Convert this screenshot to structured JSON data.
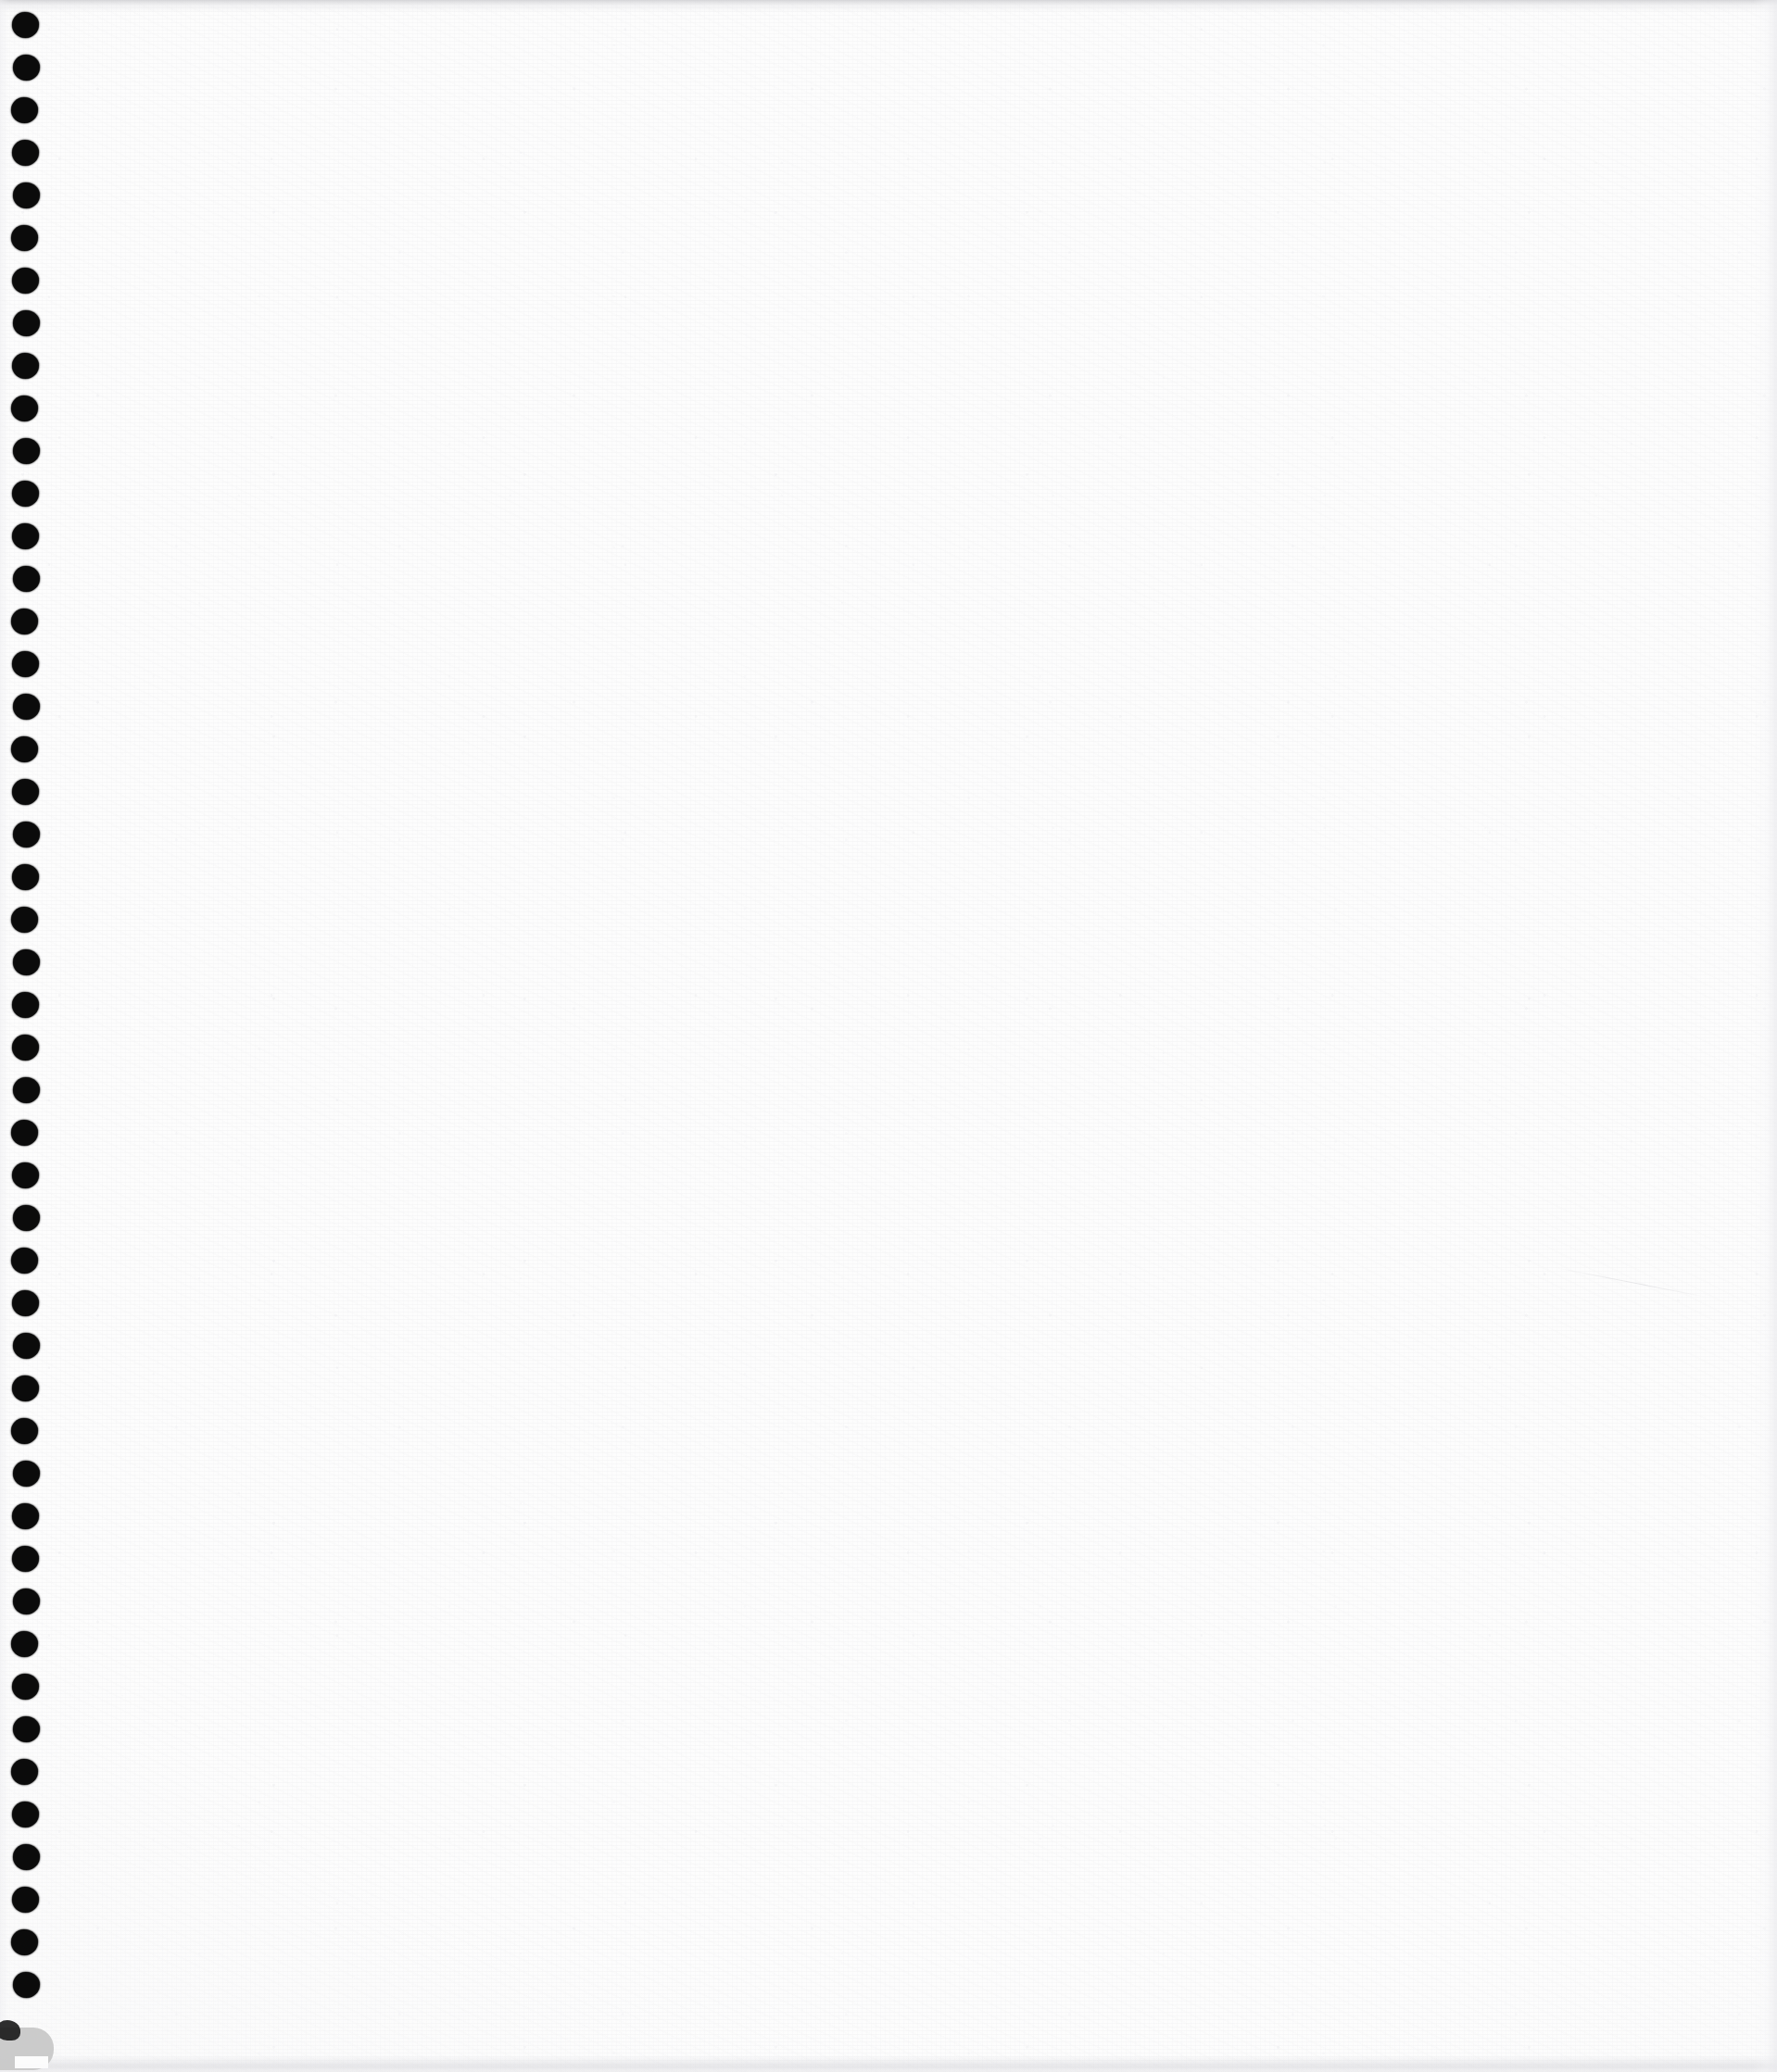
{
  "document": {
    "kind": "scanned-page",
    "media": "spiral-bound notebook sheet",
    "page_content_text": "",
    "visible_text": "",
    "caption": ""
  },
  "canvas": {
    "width": 1918,
    "height": 2237,
    "background_color": "#ffffff"
  },
  "paper": {
    "color": "#fdfdfd",
    "grain_color": "#ececee",
    "speckle_color": "#e4e4e8",
    "edge_shadow_color": "#cdcdd0"
  },
  "binding": {
    "edge": "left",
    "hole_count": 47,
    "hole_color": "#0b0b0b",
    "hole_width": 29,
    "hole_height": 28,
    "first_hole_center_y": 27,
    "hole_spacing": 46,
    "hole_left": 13
  },
  "artifacts": {
    "corner_fold": {
      "name": "bottom-left folded corner",
      "color": "#c9c9c9",
      "shadow_color": "#1c1c1c"
    },
    "crease": {
      "name": "faint hairline crease",
      "color": "#c4c4c9"
    }
  }
}
